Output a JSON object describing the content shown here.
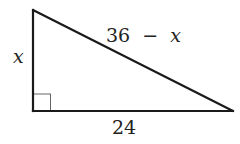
{
  "diagram": {
    "type": "right-triangle",
    "vertices": {
      "top": {
        "x": 33,
        "y": 10
      },
      "right_angle": {
        "x": 33,
        "y": 111
      },
      "right": {
        "x": 233,
        "y": 111
      }
    },
    "labels": {
      "vertical_leg": "x",
      "horizontal_leg": "24",
      "hypotenuse_number": "36",
      "hypotenuse_operator": "−",
      "hypotenuse_variable": "x"
    },
    "right_angle_marker": {
      "size": 17
    },
    "colors": {
      "stroke": "#1a1a1a",
      "marker": "#555555",
      "text": "#222222",
      "background": "#ffffff"
    }
  }
}
